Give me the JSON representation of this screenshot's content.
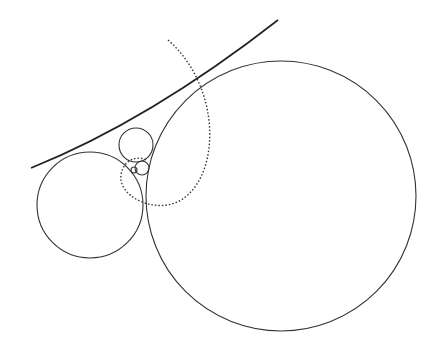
{
  "diagram": {
    "width": 436,
    "height": 350,
    "background": "#ffffff",
    "stroke": "#333333",
    "tangent_curve": {
      "d": "M 31 168 Q 150 120 278 20"
    },
    "circles": [
      {
        "name": "large-circle",
        "cx": 281,
        "cy": 196,
        "r": 135
      },
      {
        "name": "left-circle",
        "cx": 90,
        "cy": 205,
        "r": 53
      },
      {
        "name": "upper-small-circle",
        "cx": 136,
        "cy": 145,
        "r": 17
      },
      {
        "name": "tiny-circle",
        "cx": 142,
        "cy": 168,
        "r": 7
      },
      {
        "name": "tiniest-circle",
        "cx": 134,
        "cy": 170,
        "r": 3
      }
    ],
    "dotted_arc": {
      "d": "M 168 40 C 225 90 220 185 175 203 C 150 212 118 195 121 175 C 123 160 137 155 146 160"
    }
  }
}
